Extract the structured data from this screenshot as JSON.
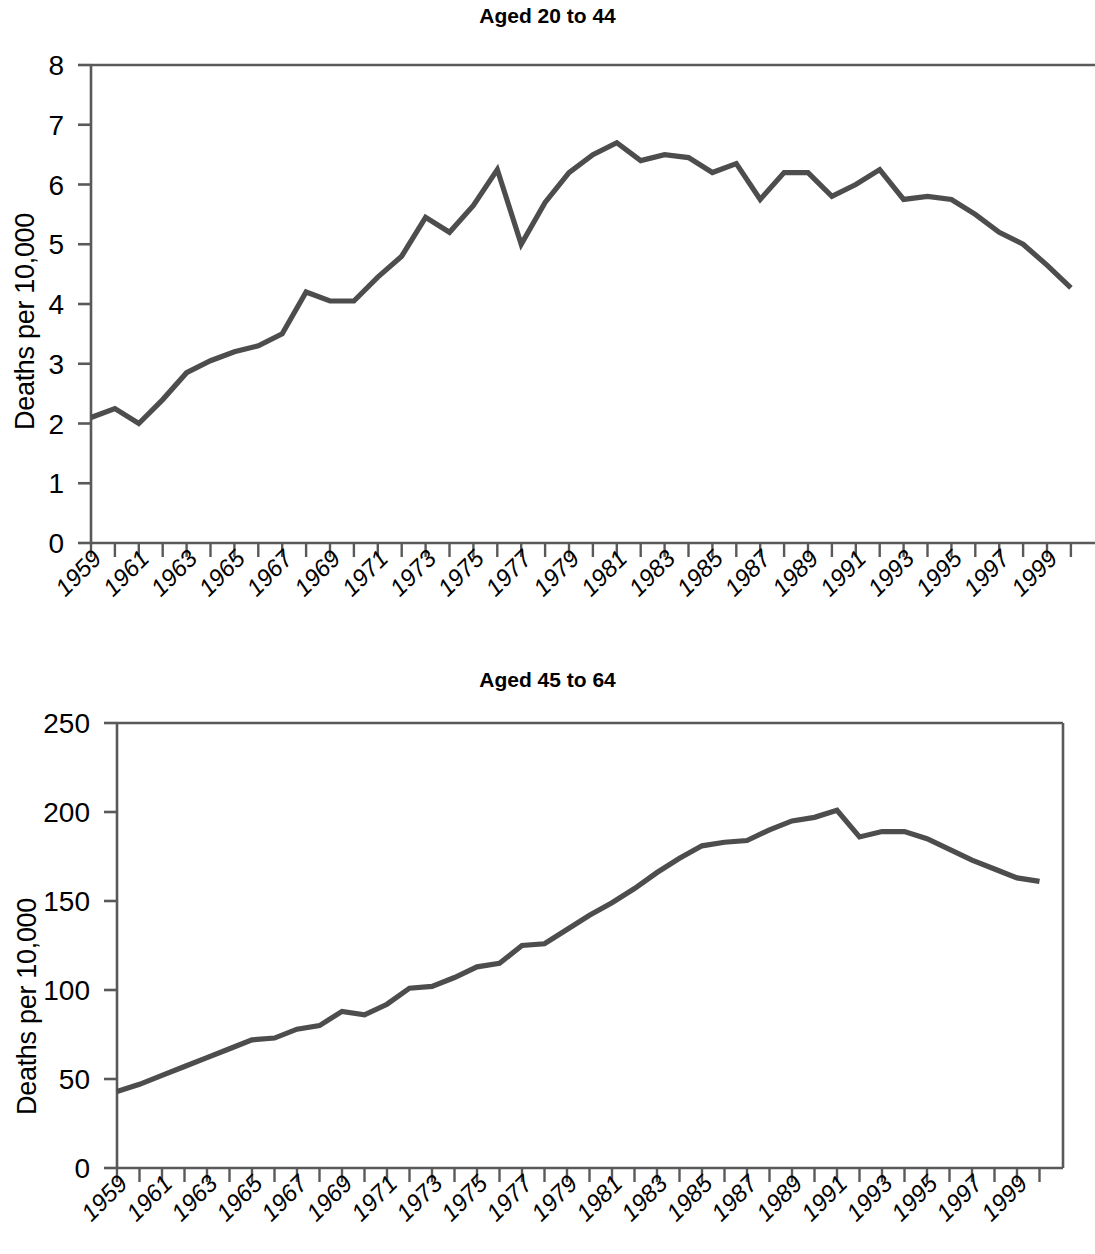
{
  "figure": {
    "ylabel_text": "Deaths per 10,000",
    "line_color": "#4d4d4d",
    "axis_color": "#595959"
  },
  "panels": [
    {
      "key": "top",
      "title": "Aged 20 to 44",
      "ylabel": "Deaths per 10,000",
      "ytick_labels": [
        "8",
        "7",
        "6",
        "5",
        "4",
        "3",
        "2",
        "1",
        "0"
      ],
      "xtick_labels": [
        "1959",
        "1961",
        "1963",
        "1965",
        "1967",
        "1969",
        "1971",
        "1973",
        "1975",
        "1977",
        "1979",
        "1981",
        "1983",
        "1985",
        "1987",
        "1989",
        "1991",
        "1993",
        "1995",
        "1997",
        "1999"
      ]
    },
    {
      "key": "bottom",
      "title": "Aged 45 to 64",
      "ylabel": "Deaths per 10,000",
      "ytick_labels": [
        "250",
        "200",
        "150",
        "100",
        "50",
        "0"
      ],
      "xtick_labels": [
        "1959",
        "1961",
        "1963",
        "1965",
        "1967",
        "1969",
        "1971",
        "1973",
        "1975",
        "1977",
        "1979",
        "1981",
        "1983",
        "1985",
        "1987",
        "1989",
        "1991",
        "1993",
        "1995",
        "1997",
        "1999"
      ]
    }
  ],
  "chart_data": [
    {
      "type": "line",
      "title": "Aged 20 to 44",
      "xlabel": "",
      "ylabel": "Deaths per 10,000",
      "ylim": [
        0,
        8
      ],
      "xlim": [
        1959,
        2000
      ],
      "yticks": [
        0,
        1,
        2,
        3,
        4,
        5,
        6,
        7,
        8
      ],
      "xticks": [
        1959,
        1961,
        1963,
        1965,
        1967,
        1969,
        1971,
        1973,
        1975,
        1977,
        1979,
        1981,
        1983,
        1985,
        1987,
        1989,
        1991,
        1993,
        1995,
        1997,
        1999
      ],
      "grid": false,
      "legend": false,
      "x": [
        1959,
        1960,
        1961,
        1962,
        1963,
        1964,
        1965,
        1966,
        1967,
        1968,
        1969,
        1970,
        1971,
        1972,
        1973,
        1974,
        1975,
        1976,
        1977,
        1978,
        1979,
        1980,
        1981,
        1982,
        1983,
        1984,
        1985,
        1986,
        1987,
        1988,
        1989,
        1990,
        1991,
        1992,
        1993,
        1994,
        1995,
        1996,
        1997,
        1998,
        1999,
        2000
      ],
      "values": [
        2.1,
        2.25,
        2.0,
        2.4,
        2.85,
        3.05,
        3.2,
        3.3,
        3.5,
        4.2,
        4.05,
        4.05,
        4.45,
        4.8,
        5.45,
        5.2,
        5.65,
        6.25,
        5.0,
        5.7,
        6.2,
        6.5,
        6.7,
        6.4,
        6.5,
        6.45,
        6.2,
        6.35,
        5.75,
        6.2,
        6.2,
        5.8,
        6.0,
        6.25,
        5.75,
        5.8,
        5.75,
        5.5,
        5.2,
        5.0,
        4.65,
        4.27
      ],
      "series": [
        {
          "name": "Aged 20 to 44",
          "values": [
            2.1,
            2.25,
            2.0,
            2.4,
            2.85,
            3.05,
            3.2,
            3.3,
            3.5,
            4.2,
            4.05,
            4.05,
            4.45,
            4.8,
            5.45,
            5.2,
            5.65,
            6.25,
            5.0,
            5.7,
            6.2,
            6.5,
            6.7,
            6.4,
            6.5,
            6.45,
            6.2,
            6.35,
            5.75,
            6.2,
            6.2,
            5.8,
            6.0,
            6.25,
            5.75,
            5.8,
            5.75,
            5.5,
            5.2,
            5.0,
            4.65,
            4.27
          ]
        }
      ]
    },
    {
      "type": "line",
      "title": "Aged 45 to 64",
      "xlabel": "",
      "ylabel": "Deaths per 10,000",
      "ylim": [
        0,
        250
      ],
      "xlim": [
        1959,
        2000
      ],
      "yticks": [
        0,
        50,
        100,
        150,
        200,
        250
      ],
      "xticks": [
        1959,
        1961,
        1963,
        1965,
        1967,
        1969,
        1971,
        1973,
        1975,
        1977,
        1979,
        1981,
        1983,
        1985,
        1987,
        1989,
        1991,
        1993,
        1995,
        1997,
        1999
      ],
      "grid": false,
      "legend": false,
      "x": [
        1959,
        1960,
        1961,
        1962,
        1963,
        1964,
        1965,
        1966,
        1967,
        1968,
        1969,
        1970,
        1971,
        1972,
        1973,
        1974,
        1975,
        1976,
        1977,
        1978,
        1979,
        1980,
        1981,
        1982,
        1983,
        1984,
        1985,
        1986,
        1987,
        1988,
        1989,
        1990,
        1991,
        1992,
        1993,
        1994,
        1995,
        1996,
        1997,
        1998,
        1999,
        2000
      ],
      "values": [
        43,
        47,
        52,
        57,
        62,
        67,
        72,
        73,
        78,
        80,
        88,
        86,
        92,
        101,
        102,
        107,
        113,
        115,
        125,
        126,
        134,
        142,
        149,
        157,
        166,
        174,
        181,
        183,
        184,
        190,
        195,
        197,
        201,
        186,
        189,
        189,
        185,
        179,
        173,
        168,
        163,
        161
      ],
      "series": [
        {
          "name": "Aged 45 to 64",
          "values": [
            43,
            47,
            52,
            57,
            62,
            67,
            72,
            73,
            78,
            80,
            88,
            86,
            92,
            101,
            102,
            107,
            113,
            115,
            125,
            126,
            134,
            142,
            149,
            157,
            166,
            174,
            181,
            183,
            184,
            190,
            195,
            197,
            201,
            186,
            189,
            189,
            185,
            179,
            173,
            168,
            163,
            161
          ]
        }
      ]
    }
  ]
}
